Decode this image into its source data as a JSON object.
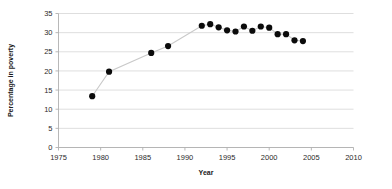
{
  "chart_data": {
    "type": "scatter",
    "title": "",
    "xlabel": "Year",
    "ylabel": "Percentage in poverty",
    "xlim": [
      1975,
      2010
    ],
    "ylim": [
      0,
      35
    ],
    "grid": true,
    "legend": "none",
    "xticks": [
      1975,
      1980,
      1985,
      1990,
      1995,
      2000,
      2005,
      2010
    ],
    "yticks": [
      0,
      5,
      10,
      15,
      20,
      25,
      30,
      35
    ],
    "marker": "filled-circle",
    "marker_color": "#0b0b0b",
    "line_color": "#c9c9c9",
    "x": [
      1979,
      1981,
      1986,
      1988,
      1992,
      1993,
      1994,
      1995,
      1996,
      1997,
      1998,
      1999,
      2000,
      2001,
      2002,
      2003,
      2004
    ],
    "values": [
      13.4,
      19.8,
      24.7,
      26.5,
      31.8,
      32.2,
      31.4,
      30.6,
      30.3,
      31.6,
      30.5,
      31.6,
      31.3,
      29.6,
      29.6,
      28.0,
      27.8
    ],
    "series": [
      {
        "name": "Percentage in poverty",
        "points": [
          {
            "x": 1979,
            "y": 13.4
          },
          {
            "x": 1981,
            "y": 19.8
          },
          {
            "x": 1986,
            "y": 24.7
          },
          {
            "x": 1988,
            "y": 26.5
          },
          {
            "x": 1992,
            "y": 31.8
          },
          {
            "x": 1993,
            "y": 32.2
          },
          {
            "x": 1994,
            "y": 31.4
          },
          {
            "x": 1995,
            "y": 30.6
          },
          {
            "x": 1996,
            "y": 30.3
          },
          {
            "x": 1997,
            "y": 31.6
          },
          {
            "x": 1998,
            "y": 30.5
          },
          {
            "x": 1999,
            "y": 31.6
          },
          {
            "x": 2000,
            "y": 31.3
          },
          {
            "x": 2001,
            "y": 29.6
          },
          {
            "x": 2002,
            "y": 29.6
          },
          {
            "x": 2003,
            "y": 28.0
          },
          {
            "x": 2004,
            "y": 27.8
          }
        ]
      }
    ]
  }
}
